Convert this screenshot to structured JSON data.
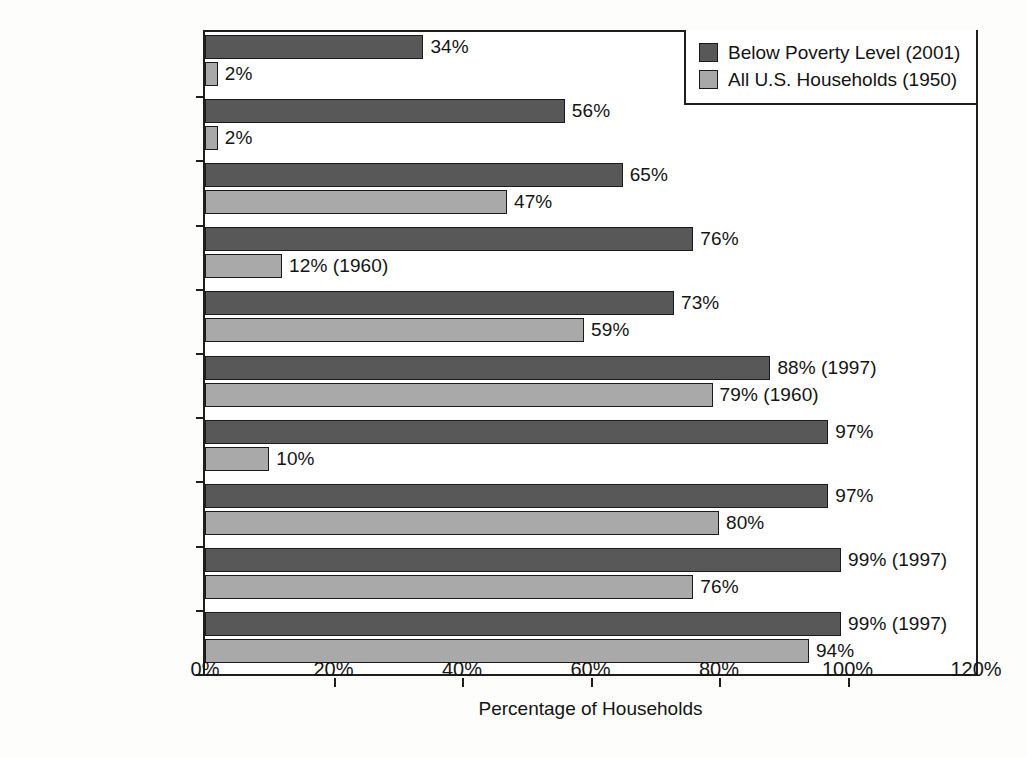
{
  "chart_data": {
    "type": "bar",
    "orientation": "horizontal",
    "title": "",
    "xlabel": "Percentage of Households",
    "ylabel": "",
    "xlim": [
      0,
      120
    ],
    "xticks": [
      "0%",
      "20%",
      "40%",
      "60%",
      "80%",
      "100%",
      "120%"
    ],
    "xtick_values": [
      0,
      20,
      40,
      60,
      80,
      100,
      120
    ],
    "grid": false,
    "legend_position": "top-right",
    "categories": [
      "Dishwasher",
      "Clothes Dryer",
      "Washing Machine",
      "Air Conditioning",
      "Automobile",
      "Telephone",
      "Television",
      "Refrigerator",
      "Flush Toilet",
      "Electricity"
    ],
    "series": [
      {
        "name": "Below Poverty Level (2001)",
        "color": "#585858",
        "values": [
          34,
          56,
          65,
          76,
          73,
          88,
          97,
          97,
          99,
          99
        ],
        "labels": [
          "34%",
          "56%",
          "65%",
          "76%",
          "73%",
          "88% (1997)",
          "97%",
          "97%",
          "99% (1997)",
          "99% (1997)"
        ]
      },
      {
        "name": "All U.S. Households (1950)",
        "color": "#a9a9a9",
        "values": [
          2,
          2,
          47,
          12,
          59,
          79,
          10,
          80,
          76,
          94
        ],
        "labels": [
          "2%",
          "2%",
          "47%",
          "12% (1960)",
          "59%",
          "79% (1960)",
          "10%",
          "80%",
          "76%",
          "94%"
        ]
      }
    ]
  },
  "legend": {
    "items": [
      {
        "label": "Below Poverty Level (2001)",
        "color": "#585858"
      },
      {
        "label": "All U.S. Households (1950)",
        "color": "#a9a9a9"
      }
    ]
  }
}
